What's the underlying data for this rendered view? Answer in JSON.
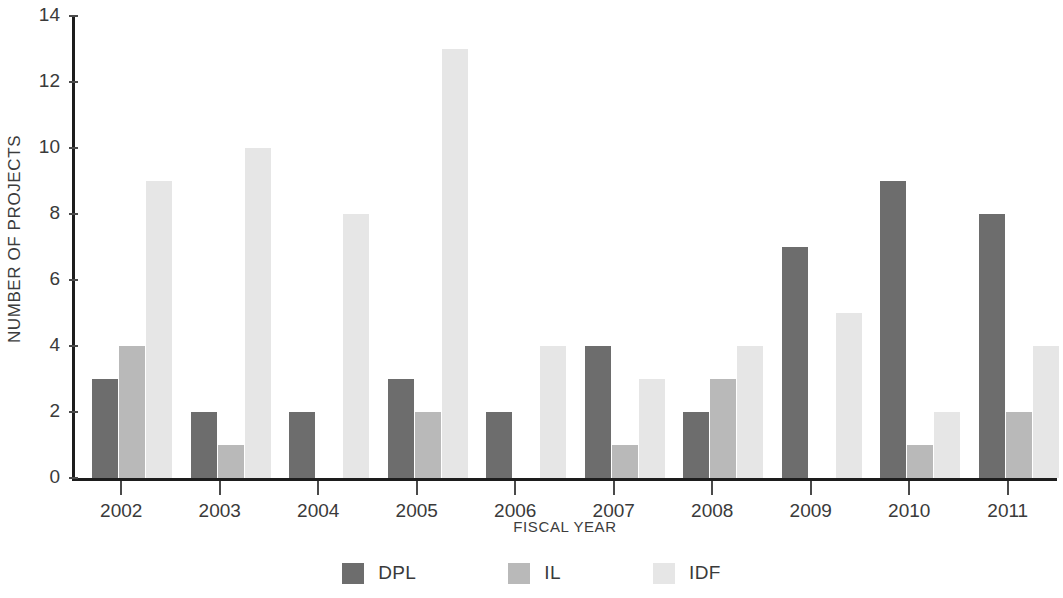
{
  "chart_data": {
    "type": "bar",
    "title": "",
    "subtitle": "",
    "xlabel": "FISCAL YEAR",
    "ylabel": "NUMBER OF PROJECTS",
    "categories": [
      "2002",
      "2003",
      "2004",
      "2005",
      "2006",
      "2007",
      "2008",
      "2009",
      "2010",
      "2011"
    ],
    "series": [
      {
        "name": "DPL",
        "color": "#6d6d6d",
        "values": [
          3,
          2,
          2,
          3,
          2,
          4,
          2,
          7,
          9,
          8
        ]
      },
      {
        "name": "IL",
        "color": "#b9b9b9",
        "values": [
          4,
          1,
          0,
          2,
          0,
          1,
          3,
          0,
          1,
          2
        ]
      },
      {
        "name": "IDF",
        "color": "#e6e6e6",
        "values": [
          9,
          10,
          8,
          13,
          4,
          3,
          4,
          5,
          2,
          4
        ]
      }
    ],
    "ylim": [
      0,
      14
    ],
    "yticks": [
      0,
      2,
      4,
      6,
      8,
      10,
      12,
      14
    ],
    "ytick_labels": [
      "0",
      "2",
      "4",
      "6",
      "8",
      "10",
      "12",
      "14"
    ],
    "grid": false,
    "legend_position": "bottom"
  },
  "legend": {
    "items": [
      {
        "label": "DPL"
      },
      {
        "label": "IL"
      },
      {
        "label": "IDF"
      }
    ]
  },
  "axes": {
    "y_title": "NUMBER OF PROJECTS",
    "x_title": "FISCAL YEAR"
  }
}
